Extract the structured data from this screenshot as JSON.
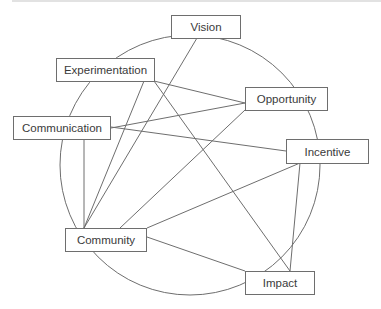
{
  "diagram": {
    "type": "network",
    "line_color": "#6e6e6e",
    "nodes": [
      {
        "id": "vision",
        "label": "Vision",
        "x": 171,
        "y": 15,
        "w": 70,
        "h": 24
      },
      {
        "id": "experimentation",
        "label": "Experimentation",
        "x": 56,
        "y": 58,
        "w": 99,
        "h": 24
      },
      {
        "id": "opportunity",
        "label": "Opportunity",
        "x": 245,
        "y": 87,
        "w": 83,
        "h": 24
      },
      {
        "id": "communication",
        "label": "Communication",
        "x": 13,
        "y": 116,
        "w": 98,
        "h": 24
      },
      {
        "id": "incentive",
        "label": "Incentive",
        "x": 286,
        "y": 139,
        "w": 83,
        "h": 25
      },
      {
        "id": "community",
        "label": "Community",
        "x": 65,
        "y": 228,
        "w": 82,
        "h": 24
      },
      {
        "id": "impact",
        "label": "Impact",
        "x": 245,
        "y": 271,
        "w": 70,
        "h": 24
      }
    ],
    "edges": [
      [
        "experimentation",
        "opportunity"
      ],
      [
        "experimentation",
        "impact"
      ],
      [
        "experimentation",
        "community"
      ],
      [
        "communication",
        "opportunity"
      ],
      [
        "communication",
        "incentive"
      ],
      [
        "communication",
        "community"
      ],
      [
        "vision",
        "community"
      ],
      [
        "opportunity",
        "community"
      ],
      [
        "incentive",
        "community"
      ],
      [
        "incentive",
        "impact"
      ],
      [
        "community",
        "impact"
      ]
    ],
    "circle": {
      "cx": 190,
      "cy": 165,
      "r": 130
    }
  }
}
